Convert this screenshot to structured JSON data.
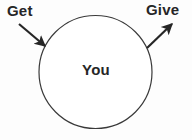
{
  "diagram": {
    "title_alt": "Get / You / Give diagram",
    "background_color": "#fdfdfd",
    "stroke_color": "#3a3a3a",
    "text_color": "#262626",
    "center_node": {
      "label": "You",
      "shape": "circle",
      "cx": 95.5,
      "cy": 72,
      "r": 56.5,
      "fill": "#ffffff",
      "stroke": "#3a3a3a",
      "stroke_width": 1.2
    },
    "arrows": [
      {
        "id": "get",
        "label": "Get",
        "direction": "inbound",
        "from": [
          19,
          24
        ],
        "to": [
          45,
          46
        ],
        "stroke": "#262626",
        "stroke_width": 2.2
      },
      {
        "id": "give",
        "label": "Give",
        "direction": "outbound",
        "from": [
          147,
          48
        ],
        "to": [
          172,
          24
        ],
        "stroke": "#262626",
        "stroke_width": 2.2
      }
    ]
  }
}
